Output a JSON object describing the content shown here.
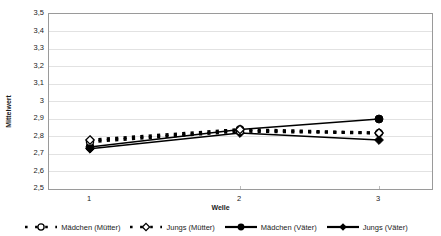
{
  "chart_data": {
    "type": "line",
    "title": "",
    "xlabel": "Welle",
    "ylabel": "Mittelwert",
    "x": [
      1,
      2,
      3
    ],
    "categories": [
      "1",
      "2",
      "3"
    ],
    "xtick_labels": [
      "1",
      "2",
      "3"
    ],
    "ytick_labels": [
      "3,5",
      "3,4",
      "3,3",
      "3,2",
      "3,1",
      "3",
      "2,9",
      "2,8",
      "2,7",
      "2,6",
      "2,5"
    ],
    "ylim": [
      2.5,
      3.5
    ],
    "ystep": 0.1,
    "grid": true,
    "grid_axis": "y",
    "legend_position": "bottom",
    "decimal_separator": ",",
    "series": [
      {
        "name": "Mädchen (Mütter)",
        "values": [
          2.77,
          2.83,
          2.82
        ],
        "marker": "open-circle",
        "line_style": "dashed",
        "color": "#000000"
      },
      {
        "name": "Jungs (Mütter)",
        "values": [
          2.78,
          2.84,
          2.82
        ],
        "marker": "open-diamond",
        "line_style": "dashed",
        "color": "#000000"
      },
      {
        "name": "Mädchen (Väter)",
        "values": [
          2.74,
          2.84,
          2.9
        ],
        "marker": "filled-circle",
        "line_style": "solid",
        "color": "#000000"
      },
      {
        "name": "Jungs (Väter)",
        "values": [
          2.73,
          2.82,
          2.78
        ],
        "marker": "filled-diamond",
        "line_style": "solid",
        "color": "#000000"
      }
    ]
  },
  "axes": {
    "y_title": "Mittelwert",
    "x_title": "Welle"
  },
  "colors": {
    "ink": "#000000",
    "frame": "#9a9a9a",
    "grid": "#e2e2e2",
    "text": "#222222"
  }
}
